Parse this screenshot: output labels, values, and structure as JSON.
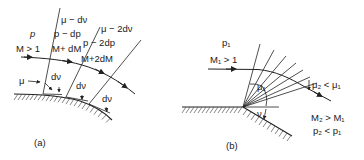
{
  "figure": {
    "panels": [
      {
        "id": "a",
        "caption": "(a)",
        "regions": [
          {
            "pressure": "p",
            "mach": "M > 1"
          },
          {
            "mach_angle": "μ − dν",
            "pressure": "p − dp",
            "mach": "M+ dM"
          },
          {
            "mach_angle": "μ − 2dν",
            "pressure": "p − 2dp",
            "mach": "M+2dM"
          }
        ],
        "angle_labels": {
          "mu": "μ",
          "dnu_1": "dν",
          "dnu_2": "dν",
          "dnu_3": "dν"
        }
      },
      {
        "id": "b",
        "caption": "(b)",
        "upstream": {
          "pressure": "p₁",
          "mach": "M₁ > 1",
          "mach_angle": "μ₁"
        },
        "downstream": {
          "mach_angle_relation": "μ₂ < μ₁",
          "mach_relation": "M₂ > M₁",
          "pressure_relation": "p₂ < p₁"
        },
        "turning_angle": "ν"
      }
    ]
  }
}
